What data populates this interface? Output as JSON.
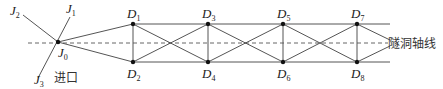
{
  "diagram": {
    "type": "tunnel control network",
    "colors": {
      "line": "#555555",
      "point": "#111111",
      "axis": "#666666"
    },
    "entrance_label": "进口",
    "axis_label": "隧洞轴线",
    "points": {
      "J0": {
        "letter": "J",
        "sub": "0"
      },
      "J1": {
        "letter": "J",
        "sub": "1"
      },
      "J2": {
        "letter": "J",
        "sub": "2"
      },
      "J3": {
        "letter": "J",
        "sub": "3"
      },
      "D1": {
        "letter": "D",
        "sub": "1"
      },
      "D2": {
        "letter": "D",
        "sub": "2"
      },
      "D3": {
        "letter": "D",
        "sub": "3"
      },
      "D4": {
        "letter": "D",
        "sub": "4"
      },
      "D5": {
        "letter": "D",
        "sub": "5"
      },
      "D6": {
        "letter": "D",
        "sub": "6"
      },
      "D7": {
        "letter": "D",
        "sub": "7"
      },
      "D8": {
        "letter": "D",
        "sub": "8"
      }
    }
  }
}
